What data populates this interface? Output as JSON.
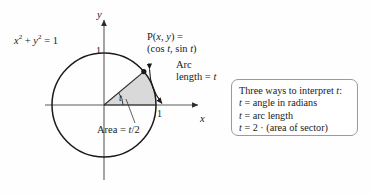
{
  "diagram": {
    "equation": {
      "base": "x",
      "exp1": "2",
      "plus": " + ",
      "base2": "y",
      "exp2": "2",
      "eq": " = 1"
    },
    "equation_text": "x2 + y2 = 1",
    "axes": {
      "y_label": "y",
      "x_label": "x",
      "y_tick": "1",
      "x_tick": "1"
    },
    "point_label_line1": "P(x, y) =",
    "point_label_line2": "(cos t, sin t)",
    "arc_label_line1": "Arc",
    "arc_label_line2": "length = t",
    "area_label": "Area = t/2",
    "angle_label": "t",
    "colors": {
      "sector_fill": "#d9d9d9",
      "circle_stroke": "#1a1a1a",
      "axis_stroke": "#4d4d4d",
      "callout_border": "#9a9a9a",
      "text": "#1a1a1a"
    },
    "geometry": {
      "center_x": 104,
      "center_y": 105,
      "radius": 52,
      "angle_degrees": 40
    }
  },
  "callout": {
    "lines": [
      "Three ways to interpret t:",
      "t = angle in radians",
      "t = arc length",
      "t = 2 · (area of sector)"
    ]
  }
}
